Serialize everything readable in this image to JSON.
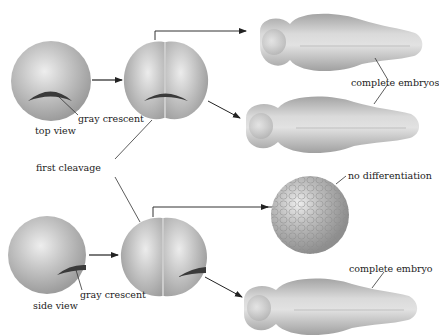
{
  "diagram": {
    "type": "embryo cleavage experiment",
    "labels": {
      "top_view": "top view",
      "side_view": "side view",
      "gray_crescent_top": "gray crescent",
      "gray_crescent_bottom": "gray crescent",
      "first_cleavage": "first cleavage",
      "complete_embryos": "complete embryos",
      "no_differentiation": "no differentiation",
      "complete_embryo": "complete embryo"
    },
    "rows": [
      {
        "name": "top row",
        "start": "zygote (top view) with gray crescent",
        "cleavage": "first cleavage splits gray crescent evenly",
        "outcomes": [
          "complete embryo",
          "complete embryo"
        ]
      },
      {
        "name": "bottom row",
        "start": "zygote (side view) with gray crescent",
        "cleavage": "first cleavage places gray crescent in one cell",
        "outcomes": [
          "no differentiation",
          "complete embryo"
        ]
      }
    ],
    "colors": {
      "cell_light": "#e4e4e4",
      "cell_mid": "#b8b8b8",
      "cell_dark": "#9a9a9a",
      "crescent": "#3a3a3a",
      "line": "#333333",
      "text": "#222222"
    }
  }
}
